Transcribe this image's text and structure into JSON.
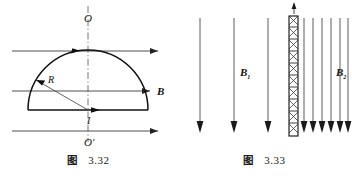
{
  "page": {
    "background": "#ffffff",
    "ink": "#111111",
    "width": 352,
    "height": 181
  },
  "figures": [
    {
      "id": "figure-3-32",
      "caption_word": "图",
      "caption_number": "3.32",
      "description": "Semicircular current loop in a uniform magnetic field",
      "labels": {
        "axis_top": "O",
        "axis_bottom": "O'",
        "radius": "R",
        "current": "I",
        "field": "B"
      },
      "field_lines": 3,
      "field_direction": "right",
      "axis_style": "dash-dot vertical through O and O'"
    },
    {
      "id": "figure-3-33",
      "caption_word": "图",
      "caption_number": "3.33",
      "description": "Current sheet separating two uniform fields",
      "labels": {
        "current": "i",
        "field_left": "B",
        "field_left_sub": "1",
        "field_right": "B",
        "field_right_sub": "2"
      },
      "field_lines_left": 3,
      "field_lines_right": 6,
      "field_direction": "down",
      "conductor": "hatched vertical bar"
    }
  ]
}
